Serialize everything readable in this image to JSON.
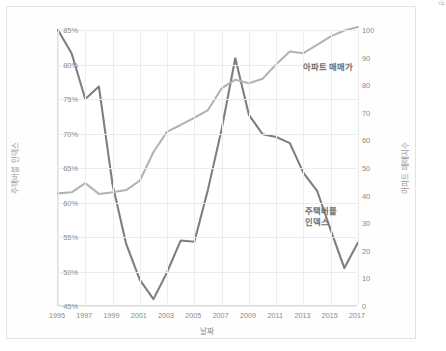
{
  "chart_data": {
    "type": "line",
    "title": "",
    "xlabel": "날짜",
    "grid": true,
    "legend_position": "inline-annotation",
    "x": [
      1995,
      1996,
      1997,
      1998,
      1999,
      2000,
      2001,
      2002,
      2003,
      2004,
      2005,
      2006,
      2007,
      2008,
      2009,
      2010,
      2011,
      2012,
      2013,
      2014,
      2015,
      2016,
      2017
    ],
    "xtick_labels": [
      "1995",
      "1997",
      "1999",
      "2001",
      "2003",
      "2005",
      "2007",
      "2009",
      "2011",
      "2013",
      "2015",
      "2017"
    ],
    "xlim": [
      1995,
      2017
    ],
    "axes": [
      {
        "side": "left",
        "label": "주택버블 인덱스",
        "ylim": [
          45,
          85
        ],
        "tick_labels": [
          "45%",
          "50%",
          "55%",
          "60%",
          "65%",
          "70%",
          "75%",
          "80%",
          "85%"
        ],
        "tick_values": [
          45,
          50,
          55,
          60,
          65,
          70,
          75,
          80,
          85
        ],
        "unit": "%"
      },
      {
        "side": "right",
        "label": "아파트 매매지수",
        "ylim": [
          0,
          100
        ],
        "tick_labels": [
          "0",
          "10",
          "20",
          "30",
          "40",
          "50",
          "60",
          "70",
          "80",
          "90",
          "100"
        ],
        "tick_values": [
          0,
          10,
          20,
          30,
          40,
          50,
          60,
          70,
          80,
          90,
          100
        ],
        "unit": ""
      }
    ],
    "series": [
      {
        "name": "주택버블 인덱스",
        "axis": "left",
        "color": "#7f7f7f",
        "annotation": "주택버블\n인덱스",
        "values": [
          85.0,
          81.6,
          75.0,
          76.8,
          62.6,
          54.0,
          48.8,
          46.0,
          49.9,
          54.5,
          54.3,
          61.9,
          70.6,
          80.9,
          72.7,
          69.9,
          69.5,
          68.6,
          64.3,
          61.7,
          56.0,
          50.5,
          54.2
        ]
      },
      {
        "name": "아파트 매매가",
        "axis": "right",
        "color": "#b3b3b3",
        "annotation": "아파트 매매가",
        "values": [
          40.8,
          41.2,
          44.5,
          40.6,
          41.2,
          42.0,
          45.4,
          55.8,
          63.2,
          65.6,
          68.2,
          71.0,
          78.9,
          82.0,
          80.7,
          82.3,
          87.6,
          92.2,
          91.6,
          94.6,
          97.7,
          99.8,
          101.1
        ]
      }
    ],
    "source_note": "데이터 출처 : 한국감정원, KB부동산"
  }
}
